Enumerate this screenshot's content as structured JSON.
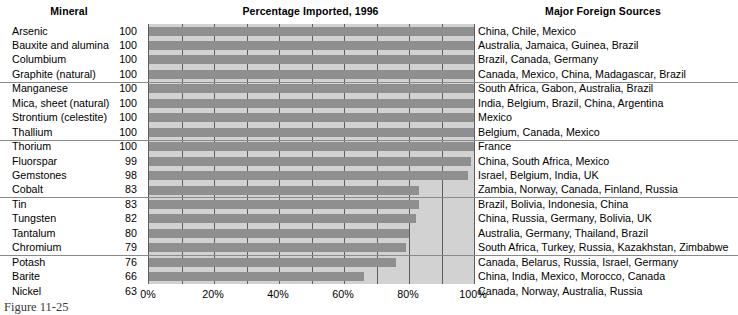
{
  "headers": {
    "mineral": "Mineral",
    "chart_title": "Percentage Imported, 1996",
    "sources": "Major Foreign Sources"
  },
  "caption": "Figure 11-25",
  "axis": {
    "ticks": [
      "0%",
      "20%",
      "40%",
      "60%",
      "80%",
      "100%"
    ],
    "tick_values": [
      0,
      20,
      40,
      60,
      80,
      100
    ],
    "gridline_step": 10,
    "min": 0,
    "max": 100
  },
  "colors": {
    "plot_background": "#d2d2d2",
    "bar_fill": "#8f8f8f",
    "gridline": "#5d5d5d",
    "separator": "#8a8a8a",
    "text": "#000000"
  },
  "rows": [
    {
      "mineral": "Arsenic",
      "value": 100,
      "sources": "China, Chile, Mexico",
      "separator_below": false
    },
    {
      "mineral": "Bauxite and alumina",
      "value": 100,
      "sources": "Australia, Jamaica, Guinea, Brazil",
      "separator_below": false
    },
    {
      "mineral": "Columbium",
      "value": 100,
      "sources": "Brazil, Canada, Germany",
      "separator_below": false
    },
    {
      "mineral": "Graphite (natural)",
      "value": 100,
      "sources": "Canada, Mexico, China, Madagascar, Brazil",
      "separator_below": true
    },
    {
      "mineral": "Manganese",
      "value": 100,
      "sources": "South Africa, Gabon, Australia, Brazil",
      "separator_below": false
    },
    {
      "mineral": "Mica, sheet (natural)",
      "value": 100,
      "sources": "India, Belgium, Brazil, China, Argentina",
      "separator_below": false
    },
    {
      "mineral": "Strontium (celestite)",
      "value": 100,
      "sources": "Mexico",
      "separator_below": false
    },
    {
      "mineral": "Thallium",
      "value": 100,
      "sources": "Belgium, Canada, Mexico",
      "separator_below": true
    },
    {
      "mineral": "Thorium",
      "value": 100,
      "sources": "France",
      "separator_below": false
    },
    {
      "mineral": "Fluorspar",
      "value": 99,
      "sources": "China, South Africa, Mexico",
      "separator_below": false
    },
    {
      "mineral": "Gemstones",
      "value": 98,
      "sources": "Israel, Belgium, India, UK",
      "separator_below": false
    },
    {
      "mineral": "Cobalt",
      "value": 83,
      "sources": "Zambia, Norway, Canada, Finland, Russia",
      "separator_below": true
    },
    {
      "mineral": "Tin",
      "value": 83,
      "sources": "Brazil, Bolivia, Indonesia, China",
      "separator_below": false
    },
    {
      "mineral": "Tungsten",
      "value": 82,
      "sources": "China, Russia, Germany, Bolivia, UK",
      "separator_below": false
    },
    {
      "mineral": "Tantalum",
      "value": 80,
      "sources": "Australia, Germany, Thailand, Brazil",
      "separator_below": false
    },
    {
      "mineral": "Chromium",
      "value": 79,
      "sources": "South Africa, Turkey, Russia, Kazakhstan, Zimbabwe",
      "separator_below": true
    },
    {
      "mineral": "Potash",
      "value": 76,
      "sources": "Canada, Belarus, Russia, Israel, Germany",
      "separator_below": false
    },
    {
      "mineral": "Barite",
      "value": 66,
      "sources": "China, India, Mexico, Morocco, Canada",
      "separator_below": false
    },
    {
      "mineral": "Nickel",
      "value": 63,
      "sources": "Canada, Norway, Australia, Russia",
      "separator_below": false
    }
  ],
  "chart_data": {
    "type": "bar",
    "orientation": "horizontal",
    "title": "Percentage Imported, 1996",
    "xlabel": "",
    "ylabel": "Mineral",
    "xlim": [
      0,
      100
    ],
    "grid": true,
    "legend": "none",
    "categories": [
      "Arsenic",
      "Bauxite and alumina",
      "Columbium",
      "Graphite (natural)",
      "Manganese",
      "Mica, sheet (natural)",
      "Strontium (celestite)",
      "Thallium",
      "Thorium",
      "Fluorspar",
      "Gemstones",
      "Cobalt",
      "Tin",
      "Tungsten",
      "Tantalum",
      "Chromium",
      "Potash",
      "Barite",
      "Nickel"
    ],
    "values": [
      100,
      100,
      100,
      100,
      100,
      100,
      100,
      100,
      100,
      99,
      98,
      83,
      83,
      82,
      80,
      79,
      76,
      66,
      63
    ],
    "tick_labels": [
      "0%",
      "20%",
      "40%",
      "60%",
      "80%",
      "100%"
    ],
    "tick_values": [
      0,
      20,
      40,
      60,
      80,
      100
    ]
  }
}
